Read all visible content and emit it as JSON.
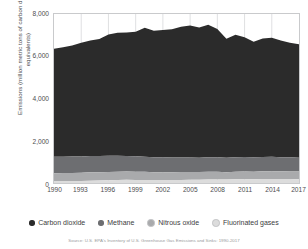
{
  "chart_data": {
    "type": "area",
    "stacked": true,
    "xlabel": "",
    "ylabel": "Emissions (million metric tons of carbon dioxide equivalents)",
    "ylim": [
      0,
      8000
    ],
    "xlim": [
      1990,
      2017
    ],
    "yticks": [
      0,
      2000,
      4000,
      6000,
      8000
    ],
    "ytick_labels": [
      "0",
      "2,000",
      "4,000",
      "6,000",
      "8,000"
    ],
    "xticks": [
      1990,
      1993,
      1996,
      1999,
      2002,
      2005,
      2008,
      2011,
      2014,
      2017
    ],
    "xtick_labels": [
      "1990",
      "1993",
      "1996",
      "1999",
      "2002",
      "2005",
      "2008",
      "2011",
      "2014",
      "2017"
    ],
    "grid": "vertical",
    "legend_position": "bottom",
    "x": [
      1990,
      1991,
      1992,
      1993,
      1994,
      1995,
      1996,
      1997,
      1998,
      1999,
      2000,
      2001,
      2002,
      2003,
      2004,
      2005,
      2006,
      2007,
      2008,
      2009,
      2010,
      2011,
      2012,
      2013,
      2014,
      2015,
      2016,
      2017
    ],
    "series": [
      {
        "name": "Fluorinated gases",
        "color": "#dcdcdc",
        "stack_order": 1,
        "values": [
          100,
          100,
          99,
          100,
          105,
          123,
          133,
          140,
          152,
          143,
          146,
          140,
          142,
          142,
          145,
          150,
          154,
          164,
          168,
          161,
          172,
          179,
          180,
          185,
          188,
          185,
          184,
          183
        ]
      },
      {
        "name": "Nitrous oxide",
        "color": "#a9aaac",
        "stack_order": 2,
        "values": [
          361,
          369,
          376,
          383,
          404,
          385,
          391,
          397,
          388,
          388,
          383,
          368,
          372,
          370,
          376,
          374,
          366,
          374,
          366,
          353,
          363,
          363,
          354,
          372,
          373,
          366,
          361,
          356
        ]
      },
      {
        "name": "Methane",
        "color": "#6d6e71",
        "stack_order": 3,
        "values": [
          779,
          777,
          779,
          768,
          772,
          775,
          766,
          754,
          743,
          731,
          718,
          706,
          700,
          692,
          685,
          681,
          680,
          682,
          686,
          681,
          684,
          684,
          680,
          678,
          676,
          672,
          670,
          656
        ]
      },
      {
        "name": "Carbon dioxide",
        "color": "#2b2b2b",
        "stack_order": 4,
        "values": [
          5118,
          5179,
          5259,
          5384,
          5464,
          5536,
          5744,
          5818,
          5840,
          5903,
          6105,
          5991,
          6025,
          6073,
          6187,
          6247,
          6165,
          6270,
          6071,
          5638,
          5801,
          5676,
          5471,
          5602,
          5642,
          5520,
          5423,
          5377
        ]
      }
    ],
    "stack_totals": [
      6358,
      6425,
      6513,
      6635,
      6745,
      6819,
      7034,
      7109,
      7123,
      7165,
      7352,
      7205,
      7239,
      7277,
      7393,
      7452,
      7365,
      7490,
      7291,
      6833,
      7020,
      6902,
      6685,
      6837,
      6879,
      6743,
      6638,
      6572
    ]
  },
  "yaxis": {
    "title": "Emissions (million metric tons of carbon dioxide equivalents)"
  },
  "legend": {
    "items": [
      {
        "label": "Carbon dioxide",
        "color": "#2b2b2b"
      },
      {
        "label": "Methane",
        "color": "#6d6e71"
      },
      {
        "label": "Nitrous oxide",
        "color": "#a9aaac"
      },
      {
        "label": "Fluorinated gases",
        "color": "#dcdcdc"
      }
    ]
  },
  "footer": {
    "source": "Source: U.S. EPA's Inventory of U.S. Greenhouse Gas Emissions and Sinks: 1990-2017"
  }
}
